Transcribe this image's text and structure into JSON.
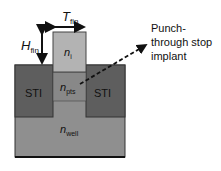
{
  "diagram": {
    "labels": {
      "t_fin": {
        "main": "T",
        "sub": "fin"
      },
      "h_fin": {
        "main": "H",
        "sub": "fin"
      },
      "fin": {
        "main": "n",
        "sub": "i"
      },
      "pts": {
        "main": "n",
        "sub": "pts"
      },
      "well": {
        "main": "n",
        "sub": "well"
      },
      "sti_left": "STI",
      "sti_right": "STI",
      "annotation_line1": "Punch-",
      "annotation_line2": "through stop",
      "annotation_line3": "implant"
    },
    "colors": {
      "fin": "#b3b3b3",
      "pts": "#8a8a8a",
      "sti": "#5e5e5e",
      "well": "#8f8f8f",
      "outline": "#222222"
    }
  }
}
